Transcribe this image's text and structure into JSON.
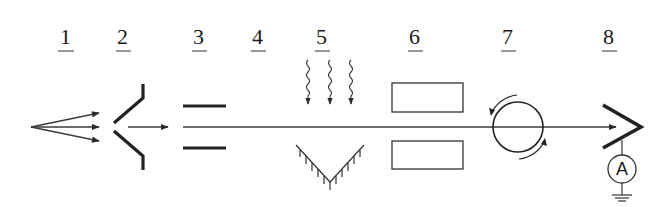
{
  "diagram": {
    "type": "schematic",
    "stroke_color": "#2a2a2a",
    "labels": [
      {
        "id": "1",
        "text": "1"
      },
      {
        "id": "2",
        "text": "2"
      },
      {
        "id": "3",
        "text": "3"
      },
      {
        "id": "4",
        "text": "4"
      },
      {
        "id": "5",
        "text": "5"
      },
      {
        "id": "6",
        "text": "6"
      },
      {
        "id": "7",
        "text": "7"
      },
      {
        "id": "8",
        "text": "8"
      }
    ],
    "components": [
      {
        "label": "1",
        "icon": "diverging-source-arrows"
      },
      {
        "label": "2",
        "icon": "collimator-aperture"
      },
      {
        "label": "3",
        "icon": "parallel-deflector-plates"
      },
      {
        "label": "4",
        "icon": "drift-region"
      },
      {
        "label": "5",
        "icon": "wavy-radiation-arrows-with-v-mirror"
      },
      {
        "label": "6",
        "icon": "rectangular-electrodes"
      },
      {
        "label": "7",
        "icon": "rotating-circle-field"
      },
      {
        "label": "8",
        "icon": "detector-with-ammeter"
      }
    ],
    "meter": {
      "text": "A"
    }
  }
}
